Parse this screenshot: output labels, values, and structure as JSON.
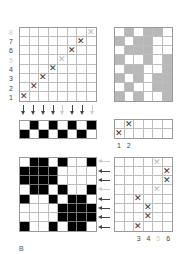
{
  "figure_label": "B",
  "threading_grid": {
    "rows": 8,
    "cols": 8,
    "row_labels": [
      {
        "text": "8",
        "light": true
      },
      {
        "text": "7",
        "light": false
      },
      {
        "text": "6",
        "light": false
      },
      {
        "text": "5",
        "light": true
      },
      {
        "text": "4",
        "light": false
      },
      {
        "text": "3",
        "light": false
      },
      {
        "text": "2",
        "light": false
      },
      {
        "text": "1",
        "light": false
      }
    ],
    "marks": [
      {
        "row": 0,
        "col": 7,
        "light": true
      },
      {
        "row": 1,
        "col": 6,
        "light": false
      },
      {
        "row": 2,
        "col": 5,
        "light": false
      },
      {
        "row": 3,
        "col": 4,
        "light": true
      },
      {
        "row": 4,
        "col": 3,
        "light": false
      },
      {
        "row": 5,
        "col": 2,
        "light": false
      },
      {
        "row": 6,
        "col": 1,
        "light": false
      },
      {
        "row": 7,
        "col": 0,
        "light": false
      }
    ],
    "mark_symbol": "✕"
  },
  "down_arrows": [
    false,
    false,
    false,
    false,
    true,
    false,
    false,
    true
  ],
  "checker_strip": {
    "rows": 2,
    "cols": 8,
    "cells": [
      [
        0,
        1,
        0,
        1,
        0,
        1,
        0,
        1
      ],
      [
        1,
        0,
        1,
        0,
        1,
        0,
        1,
        0
      ]
    ]
  },
  "gray_pattern": {
    "rows": 8,
    "cols": 6,
    "cells": [
      [
        0,
        1,
        0,
        1,
        1,
        0
      ],
      [
        1,
        0,
        1,
        1,
        0,
        0
      ],
      [
        0,
        1,
        1,
        1,
        0,
        0
      ],
      [
        1,
        0,
        0,
        1,
        0,
        1
      ],
      [
        0,
        1,
        1,
        0,
        0,
        1
      ],
      [
        1,
        0,
        1,
        0,
        1,
        1
      ],
      [
        0,
        1,
        0,
        0,
        1,
        1
      ],
      [
        1,
        0,
        1,
        0,
        0,
        1
      ]
    ]
  },
  "tieup_small": {
    "rows": 2,
    "cols": 6,
    "marks": [
      {
        "row": 0,
        "col": 1,
        "light": false
      },
      {
        "row": 1,
        "col": 0,
        "light": false
      }
    ],
    "col_labels": [
      {
        "text": "1",
        "light": false
      },
      {
        "text": "2",
        "light": false
      }
    ]
  },
  "drawdown": {
    "rows": 8,
    "cols": 8,
    "cells": [
      [
        0,
        1,
        1,
        0,
        1,
        0,
        0,
        1
      ],
      [
        1,
        1,
        1,
        1,
        0,
        0,
        0,
        0
      ],
      [
        1,
        1,
        1,
        1,
        0,
        0,
        0,
        0
      ],
      [
        0,
        1,
        1,
        0,
        1,
        0,
        0,
        1
      ],
      [
        1,
        0,
        0,
        1,
        0,
        1,
        1,
        0
      ],
      [
        0,
        0,
        0,
        0,
        1,
        1,
        1,
        1
      ],
      [
        0,
        0,
        0,
        0,
        1,
        1,
        1,
        1
      ],
      [
        1,
        0,
        0,
        1,
        0,
        1,
        1,
        0
      ]
    ]
  },
  "left_arrows": [
    true,
    false,
    false,
    true,
    false,
    false,
    false,
    false
  ],
  "treadling_grid": {
    "rows": 8,
    "cols": 6,
    "marks": [
      {
        "row": 0,
        "col": 4,
        "light": true
      },
      {
        "row": 1,
        "col": 5,
        "light": false
      },
      {
        "row": 2,
        "col": 5,
        "light": false
      },
      {
        "row": 3,
        "col": 4,
        "light": true
      },
      {
        "row": 4,
        "col": 2,
        "light": false
      },
      {
        "row": 5,
        "col": 3,
        "light": false
      },
      {
        "row": 6,
        "col": 3,
        "light": false
      },
      {
        "row": 7,
        "col": 2,
        "light": false
      }
    ],
    "col_labels": [
      {
        "text": "3",
        "light": false
      },
      {
        "text": "4",
        "light": false
      },
      {
        "text": "5",
        "light": true
      },
      {
        "text": "6",
        "light": false
      }
    ]
  }
}
